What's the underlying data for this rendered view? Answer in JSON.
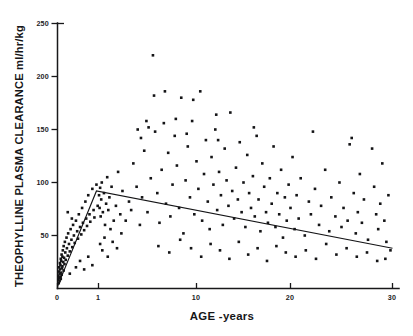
{
  "chart_data": {
    "type": "scatter",
    "title": "",
    "xlabel": "AGE -years",
    "ylabel": "THEOPHYLLINE PLASMA CLEARANCE ml/hr/kg",
    "xlim": [
      0,
      30
    ],
    "ylim": [
      0,
      250
    ],
    "xticks": [
      0,
      1,
      10,
      20,
      30
    ],
    "xtick_labels": [
      "0",
      "1",
      "10",
      "20",
      "30"
    ],
    "yticks": [
      0,
      50,
      100,
      150,
      200,
      250
    ],
    "ytick_labels": [
      "0",
      "50",
      "100",
      "150",
      "200",
      "250"
    ],
    "x_scale_note": "mixed scale: 0-1 compressed, 1-30 near-linear",
    "grid": false,
    "legend": null,
    "marker": "filled-square",
    "marker_color": "#141416",
    "series": [
      {
        "name": "Theophylline plasma clearance by age",
        "points": [
          [
            0.02,
            8
          ],
          [
            0.02,
            12
          ],
          [
            0.03,
            5
          ],
          [
            0.03,
            16
          ],
          [
            0.04,
            10
          ],
          [
            0.04,
            20
          ],
          [
            0.05,
            7
          ],
          [
            0.05,
            14
          ],
          [
            0.06,
            18
          ],
          [
            0.06,
            24
          ],
          [
            0.07,
            11
          ],
          [
            0.07,
            22
          ],
          [
            0.08,
            9
          ],
          [
            0.08,
            28
          ],
          [
            0.09,
            15
          ],
          [
            0.09,
            26
          ],
          [
            0.1,
            13
          ],
          [
            0.1,
            32
          ],
          [
            0.11,
            19
          ],
          [
            0.12,
            30
          ],
          [
            0.12,
            21
          ],
          [
            0.13,
            36
          ],
          [
            0.14,
            25
          ],
          [
            0.15,
            17
          ],
          [
            0.15,
            40
          ],
          [
            0.16,
            29
          ],
          [
            0.17,
            23
          ],
          [
            0.18,
            44
          ],
          [
            0.19,
            34
          ],
          [
            0.2,
            27
          ],
          [
            0.22,
            48
          ],
          [
            0.23,
            38
          ],
          [
            0.25,
            31
          ],
          [
            0.26,
            52
          ],
          [
            0.28,
            42
          ],
          [
            0.3,
            35
          ],
          [
            0.32,
            56
          ],
          [
            0.34,
            46
          ],
          [
            0.36,
            39
          ],
          [
            0.38,
            60
          ],
          [
            0.4,
            50
          ],
          [
            0.42,
            43
          ],
          [
            0.45,
            64
          ],
          [
            0.48,
            54
          ],
          [
            0.5,
            47
          ],
          [
            0.52,
            70
          ],
          [
            0.55,
            58
          ],
          [
            0.58,
            51
          ],
          [
            0.6,
            76
          ],
          [
            0.62,
            62
          ],
          [
            0.65,
            55
          ],
          [
            0.68,
            82
          ],
          [
            0.7,
            66
          ],
          [
            0.72,
            59
          ],
          [
            0.75,
            88
          ],
          [
            0.78,
            70
          ],
          [
            0.8,
            63
          ],
          [
            0.85,
            94
          ],
          [
            0.88,
            74
          ],
          [
            0.9,
            67
          ],
          [
            0.95,
            98
          ],
          [
            0.98,
            78
          ],
          [
            0.3,
            14
          ],
          [
            0.45,
            20
          ],
          [
            0.55,
            26
          ],
          [
            0.65,
            18
          ],
          [
            0.75,
            30
          ],
          [
            0.85,
            22
          ],
          [
            0.35,
            66
          ],
          [
            0.25,
            72
          ],
          [
            1.05,
            88
          ],
          [
            1.1,
            76
          ],
          [
            1.15,
            95
          ],
          [
            1.2,
            68
          ],
          [
            1.25,
            84
          ],
          [
            1.3,
            100
          ],
          [
            1.4,
            72
          ],
          [
            1.5,
            90
          ],
          [
            1.6,
            60
          ],
          [
            1.7,
            80
          ],
          [
            1.8,
            105
          ],
          [
            1.9,
            74
          ],
          [
            2.0,
            86
          ],
          [
            2.1,
            56
          ],
          [
            2.2,
            96
          ],
          [
            2.4,
            64
          ],
          [
            2.6,
            78
          ],
          [
            2.8,
            110
          ],
          [
            3.0,
            70
          ],
          [
            3.2,
            92
          ],
          [
            1.15,
            42
          ],
          [
            1.35,
            36
          ],
          [
            1.55,
            48
          ],
          [
            1.85,
            30
          ],
          [
            2.3,
            44
          ],
          [
            2.7,
            38
          ],
          [
            3.1,
            52
          ],
          [
            3.5,
            64
          ],
          [
            3.8,
            82
          ],
          [
            4.0,
            74
          ],
          [
            4.2,
            118
          ],
          [
            4.5,
            96
          ],
          [
            4.8,
            60
          ],
          [
            5.0,
            86
          ],
          [
            5.2,
            130
          ],
          [
            5.5,
            72
          ],
          [
            5.8,
            104
          ],
          [
            6.0,
            220
          ],
          [
            6.2,
            148
          ],
          [
            6.4,
            90
          ],
          [
            6.6,
            62
          ],
          [
            6.8,
            112
          ],
          [
            7.0,
            156
          ],
          [
            7.2,
            80
          ],
          [
            7.4,
            128
          ],
          [
            7.6,
            68
          ],
          [
            7.8,
            98
          ],
          [
            8.0,
            144
          ],
          [
            8.2,
            116
          ],
          [
            8.4,
            76
          ],
          [
            8.6,
            180
          ],
          [
            8.8,
            52
          ],
          [
            9.0,
            102
          ],
          [
            9.2,
            134
          ],
          [
            9.4,
            86
          ],
          [
            9.6,
            158
          ],
          [
            9.8,
            70
          ],
          [
            10.0,
            120
          ],
          [
            10.2,
            94
          ],
          [
            10.4,
            186
          ],
          [
            10.6,
            64
          ],
          [
            10.8,
            108
          ],
          [
            11.0,
            140
          ],
          [
            11.2,
            82
          ],
          [
            11.4,
            56
          ],
          [
            11.6,
            124
          ],
          [
            11.8,
            98
          ],
          [
            12.0,
            150
          ],
          [
            12.2,
            74
          ],
          [
            12.4,
            110
          ],
          [
            12.6,
            88
          ],
          [
            12.8,
            60
          ],
          [
            13.0,
            132
          ],
          [
            13.2,
            102
          ],
          [
            13.4,
            78
          ],
          [
            13.6,
            166
          ],
          [
            13.8,
            92
          ],
          [
            14.0,
            66
          ],
          [
            14.2,
            114
          ],
          [
            14.4,
            84
          ],
          [
            14.6,
            138
          ],
          [
            14.8,
            72
          ],
          [
            15.0,
            100
          ],
          [
            15.2,
            58
          ],
          [
            15.4,
            126
          ],
          [
            15.6,
            90
          ],
          [
            15.8,
            76
          ],
          [
            16.0,
            106
          ],
          [
            16.2,
            68
          ],
          [
            16.4,
            144
          ],
          [
            16.6,
            84
          ],
          [
            16.8,
            54
          ],
          [
            17.0,
            118
          ],
          [
            17.2,
            96
          ],
          [
            17.4,
            72
          ],
          [
            17.6,
            62
          ],
          [
            17.8,
            104
          ],
          [
            18.0,
            80
          ],
          [
            18.2,
            134
          ],
          [
            18.4,
            58
          ],
          [
            18.6,
            90
          ],
          [
            18.8,
            70
          ],
          [
            19.0,
            112
          ],
          [
            19.2,
            48
          ],
          [
            19.4,
            86
          ],
          [
            19.6,
            64
          ],
          [
            19.8,
            98
          ],
          [
            20.0,
            76
          ],
          [
            20.2,
            124
          ],
          [
            20.4,
            56
          ],
          [
            20.6,
            88
          ],
          [
            20.8,
            66
          ],
          [
            21.0,
            104
          ],
          [
            21.4,
            50
          ],
          [
            21.8,
            82
          ],
          [
            22.0,
            70
          ],
          [
            22.4,
            94
          ],
          [
            22.8,
            60
          ],
          [
            23.0,
            78
          ],
          [
            23.4,
            112
          ],
          [
            23.8,
            54
          ],
          [
            24.0,
            86
          ],
          [
            24.4,
            68
          ],
          [
            24.8,
            100
          ],
          [
            25.0,
            58
          ],
          [
            25.2,
            76
          ],
          [
            25.6,
            64
          ],
          [
            26.0,
            142
          ],
          [
            26.2,
            90
          ],
          [
            26.4,
            52
          ],
          [
            26.6,
            72
          ],
          [
            26.8,
            108
          ],
          [
            27.0,
            62
          ],
          [
            27.2,
            84
          ],
          [
            27.6,
            46
          ],
          [
            28.0,
            132
          ],
          [
            28.2,
            96
          ],
          [
            28.4,
            70
          ],
          [
            28.6,
            56
          ],
          [
            28.8,
            80
          ],
          [
            29.0,
            118
          ],
          [
            29.2,
            64
          ],
          [
            29.4,
            44
          ],
          [
            29.6,
            88
          ],
          [
            29.8,
            36
          ],
          [
            6.5,
            40
          ],
          [
            7.5,
            34
          ],
          [
            8.5,
            46
          ],
          [
            9.5,
            38
          ],
          [
            10.5,
            30
          ],
          [
            11.5,
            42
          ],
          [
            12.5,
            36
          ],
          [
            13.5,
            28
          ],
          [
            14.5,
            44
          ],
          [
            15.5,
            32
          ],
          [
            16.5,
            38
          ],
          [
            17.5,
            26
          ],
          [
            18.5,
            40
          ],
          [
            19.5,
            34
          ],
          [
            20.5,
            30
          ],
          [
            21.5,
            36
          ],
          [
            22.5,
            28
          ],
          [
            23.5,
            42
          ],
          [
            24.5,
            32
          ],
          [
            25.5,
            38
          ],
          [
            26.5,
            30
          ],
          [
            27.5,
            34
          ],
          [
            28.5,
            26
          ],
          [
            29.3,
            28
          ],
          [
            4.6,
            150
          ],
          [
            5.4,
            158
          ],
          [
            5.6,
            152
          ],
          [
            4.9,
            142
          ],
          [
            8.1,
            160
          ],
          [
            9.1,
            146
          ],
          [
            12.1,
            164
          ],
          [
            12.3,
            140
          ],
          [
            16.1,
            152
          ],
          [
            22.2,
            148
          ],
          [
            25.8,
            136
          ],
          [
            6.1,
            182
          ],
          [
            7.1,
            186
          ],
          [
            9.7,
            178
          ]
        ]
      }
    ],
    "fit_line": {
      "name": "piecewise fitted trend",
      "points": [
        [
          0.0,
          2
        ],
        [
          0.95,
          92
        ],
        [
          30.0,
          38
        ]
      ]
    }
  }
}
